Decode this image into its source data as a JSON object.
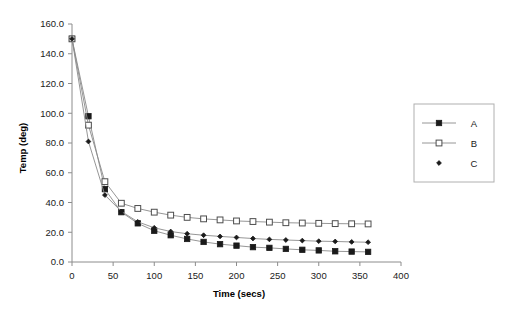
{
  "chart_data": {
    "type": "line",
    "title": "",
    "xlabel": "Time (secs)",
    "ylabel": "Temp (deg)",
    "xlim": [
      0,
      400
    ],
    "ylim": [
      0,
      160
    ],
    "xticks": [
      "0",
      "50",
      "100",
      "150",
      "200",
      "250",
      "300",
      "350",
      "400"
    ],
    "xtick_values": [
      0,
      50,
      100,
      150,
      200,
      250,
      300,
      350,
      400
    ],
    "yticks": [
      "0.0",
      "20.0",
      "40.0",
      "60.0",
      "80.0",
      "100.0",
      "120.0",
      "140.0",
      "160.0"
    ],
    "ytick_values": [
      0,
      20,
      40,
      60,
      80,
      100,
      120,
      140,
      160
    ],
    "grid": false,
    "legend_position": "right-outside",
    "x": [
      0,
      20,
      40,
      60,
      80,
      100,
      120,
      140,
      160,
      180,
      200,
      220,
      240,
      260,
      280,
      300,
      320,
      340,
      360
    ],
    "series": [
      {
        "name": "A",
        "marker": "filled-square",
        "color": "#1a1a1a",
        "values": [
          150.0,
          98.0,
          49.0,
          33.5,
          26.0,
          21.0,
          18.0,
          15.5,
          13.5,
          12.0,
          11.0,
          10.0,
          9.5,
          8.8,
          8.2,
          7.8,
          7.2,
          7.0,
          6.8
        ]
      },
      {
        "name": "B",
        "marker": "open-square",
        "color": "#1a1a1a",
        "values": [
          150.0,
          92.0,
          54.0,
          39.5,
          36.0,
          33.5,
          31.5,
          30.0,
          29.0,
          28.3,
          27.6,
          27.2,
          26.8,
          26.4,
          26.2,
          26.0,
          25.8,
          25.7,
          25.6
        ]
      },
      {
        "name": "C",
        "marker": "diamond",
        "color": "#1a1a1a",
        "values": [
          150.0,
          81.0,
          45.0,
          34.0,
          27.0,
          23.0,
          20.5,
          19.0,
          18.0,
          17.2,
          16.5,
          15.8,
          15.2,
          14.8,
          14.4,
          14.0,
          13.8,
          13.5,
          13.3
        ]
      }
    ]
  },
  "legend": {
    "entries": [
      {
        "label": "A"
      },
      {
        "label": "B"
      },
      {
        "label": "C"
      }
    ]
  }
}
